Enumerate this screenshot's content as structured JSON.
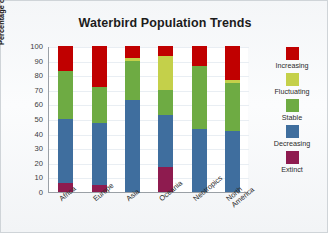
{
  "chart_data": {
    "type": "bar",
    "title": "Waterbird Population Trends",
    "xlabel": "",
    "ylabel": "Percentage of populations of known trend (%)",
    "ylim": [
      0,
      100
    ],
    "ytick_labels": [
      "100",
      "90",
      "80",
      "70",
      "60",
      "50",
      "40",
      "30",
      "20",
      "10",
      "0"
    ],
    "yticks": [
      100,
      90,
      80,
      70,
      60,
      50,
      40,
      30,
      20,
      10,
      0
    ],
    "grid": true,
    "stacked": true,
    "legend_position": "right",
    "categories": [
      "Africa",
      "Europe",
      "Asia",
      "Oceania",
      "Neotropics",
      "North America"
    ],
    "series": [
      {
        "name": "Increasing",
        "color": "#C00000",
        "values": [
          17,
          28,
          8,
          7,
          14,
          23
        ]
      },
      {
        "name": "Fluctuating",
        "color": "#C4D04A",
        "values": [
          0,
          0,
          2,
          23,
          0,
          2
        ]
      },
      {
        "name": "Stable",
        "color": "#6EAB43",
        "values": [
          33,
          25,
          27,
          17,
          43,
          33
        ]
      },
      {
        "name": "Decreasing",
        "color": "#3F6E9E",
        "values": [
          44,
          42,
          63,
          36,
          43,
          42
        ]
      },
      {
        "name": "Extinct",
        "color": "#8E1B4F",
        "values": [
          6,
          5,
          0,
          17,
          0,
          0
        ]
      }
    ]
  },
  "legend": {
    "entries": [
      {
        "label": "Increasing",
        "color": "#C00000"
      },
      {
        "label": "Fluctuating",
        "color": "#C4D04A"
      },
      {
        "label": "Stable",
        "color": "#6EAB43"
      },
      {
        "label": "Decreasing",
        "color": "#3F6E9E"
      },
      {
        "label": "Extinct",
        "color": "#8E1B4F"
      }
    ]
  }
}
